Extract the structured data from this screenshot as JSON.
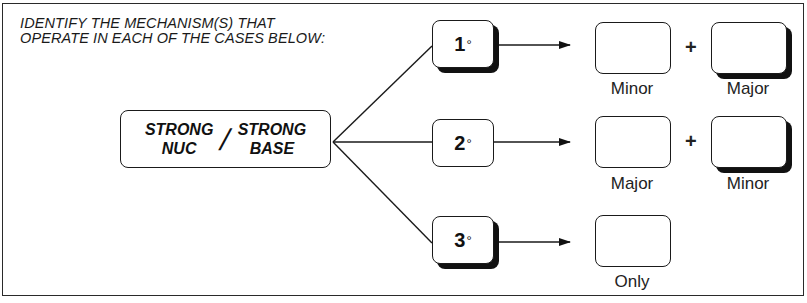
{
  "instruction": {
    "line1": "IDENTIFY THE MECHANISM(S) THAT",
    "line2": "OPERATE IN EACH OF THE CASES BELOW:"
  },
  "reagent": {
    "left_top": "STRONG",
    "left_bottom": "NUC",
    "separator": "/",
    "right_top": "STRONG",
    "right_bottom": "BASE"
  },
  "cases": [
    {
      "degree": "1",
      "degree_symbol": "°",
      "answers": [
        {
          "label": "Minor"
        },
        {
          "label": "Major"
        }
      ],
      "operator": "+"
    },
    {
      "degree": "2",
      "degree_symbol": "°",
      "answers": [
        {
          "label": "Major"
        },
        {
          "label": "Minor"
        }
      ],
      "operator": "+"
    },
    {
      "degree": "3",
      "degree_symbol": "°",
      "answers": [
        {
          "label": "Only"
        }
      ]
    }
  ],
  "colors": {
    "stroke": "#1a1a1a",
    "background": "#ffffff"
  }
}
